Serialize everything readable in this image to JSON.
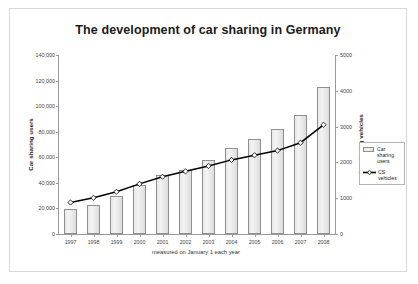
{
  "chart_data": {
    "type": "bar",
    "title": "The development of car sharing in Germany",
    "xlabel": "measured on January 1 each year",
    "ylabel": "Car sharing users",
    "ylabel_secondary": "Car sharing vehicles",
    "categories": [
      "1997",
      "1998",
      "1999",
      "2000",
      "2001",
      "2002",
      "2003",
      "2004",
      "2005",
      "2006",
      "2007",
      "2008"
    ],
    "ylim": [
      0,
      140000
    ],
    "ylim_secondary": [
      0,
      5000
    ],
    "yticks": [
      "0",
      "20,000",
      "40,000",
      "60,000",
      "80,000",
      "100,000",
      "120,000",
      "140,000"
    ],
    "ytick_values": [
      0,
      20000,
      40000,
      60000,
      80000,
      100000,
      120000,
      140000
    ],
    "yticks_secondary": [
      "0",
      "1000",
      "2000",
      "3000",
      "4000",
      "5000"
    ],
    "ytick_values_secondary": [
      0,
      1000,
      2000,
      3000,
      4000,
      5000
    ],
    "grid": false,
    "legend_position": "right",
    "series": [
      {
        "name": "Car sharing users",
        "kind": "bar",
        "axis": "left",
        "color": "#e6e6e6",
        "edge_color": "#8f8f8f",
        "values": [
          19500,
          23000,
          30000,
          38500,
          46000,
          50000,
          58000,
          67000,
          74500,
          82000,
          93000,
          115000
        ]
      },
      {
        "name": "CS vehicles",
        "kind": "line",
        "axis": "right",
        "color": "#000000",
        "marker": "diamond",
        "values": [
          880,
          1010,
          1180,
          1400,
          1600,
          1750,
          1900,
          2070,
          2200,
          2330,
          2550,
          3050
        ]
      }
    ]
  },
  "legend": {
    "entries": [
      {
        "label": "Car sharing users",
        "type": "bar-swatch"
      },
      {
        "label": "CS vehicles",
        "type": "line-swatch"
      }
    ]
  },
  "colors": {
    "bar_fill": "#e8e8e8",
    "bar_edge": "#8f8f8f",
    "line": "#000000",
    "axis": "#9a9a9a",
    "card_border": "#d8d8d8",
    "title_text": "#1a1a1a"
  }
}
